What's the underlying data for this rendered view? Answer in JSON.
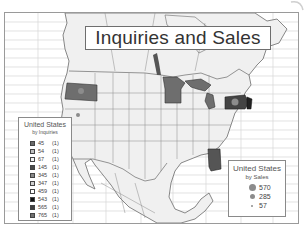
{
  "title": "Inquiries and Sales",
  "colors": {
    "frame_border": "#9a9a9a",
    "grid_line": "#d6d6d6",
    "land_fill": "#f0f0f0",
    "border_line": "#6a6a6a",
    "highlight_dark": "#555555",
    "highlight_mid": "#6e6e6e",
    "sales_dot": "#8c8c8c"
  },
  "legend_inquiries": {
    "title": "United States",
    "subtitle": "by Inquiries",
    "items": [
      {
        "value": "45",
        "count": "(1)",
        "color": "#6a6a6a"
      },
      {
        "value": "54",
        "count": "(1)",
        "color": "#c0c0c0"
      },
      {
        "value": "67",
        "count": "(1)",
        "color": "#f4f4f4"
      },
      {
        "value": "145",
        "count": "(1)",
        "color": "#4a4a4a"
      },
      {
        "value": "345",
        "count": "(1)",
        "color": "#888888"
      },
      {
        "value": "347",
        "count": "(1)",
        "color": "#cfcfcf"
      },
      {
        "value": "459",
        "count": "(1)",
        "color": "#ffffff"
      },
      {
        "value": "543",
        "count": "(1)",
        "color": "#111111"
      },
      {
        "value": "565",
        "count": "(1)",
        "color": "#404040"
      },
      {
        "value": "765",
        "count": "(1)",
        "color": "#707070"
      }
    ]
  },
  "legend_sales": {
    "title": "United States",
    "subtitle": "by Sales",
    "items": [
      {
        "value": "570",
        "size": 7
      },
      {
        "value": "285",
        "size": 5
      },
      {
        "value": "57",
        "size": 2
      }
    ]
  },
  "highlighted_states": [
    "Oregon",
    "Minnesota",
    "Michigan",
    "Pennsylvania",
    "New Jersey",
    "Alabama"
  ]
}
